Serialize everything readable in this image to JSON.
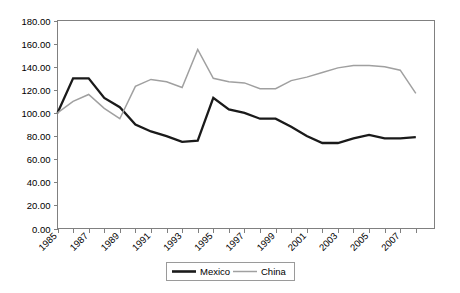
{
  "chart_data": {
    "type": "line",
    "title": "",
    "xlabel": "",
    "ylabel": "",
    "ylim": [
      0,
      180
    ],
    "ytick_step": 20,
    "ytick_labels": [
      "0.00",
      "20.00",
      "40.00",
      "60.00",
      "80.00",
      "100.00",
      "120.00",
      "140.00",
      "160.00",
      "180.00"
    ],
    "xtick_labels": [
      "1985",
      "1987",
      "1989",
      "1991",
      "1993",
      "1995",
      "1997",
      "1999",
      "2001",
      "2003",
      "2005",
      "2007"
    ],
    "x": [
      1985,
      1986,
      1987,
      1988,
      1989,
      1990,
      1991,
      1992,
      1993,
      1994,
      1995,
      1996,
      1997,
      1998,
      1999,
      2000,
      2001,
      2002,
      2003,
      2004,
      2005,
      2006,
      2007,
      2008
    ],
    "grid": false,
    "legend_position": "bottom",
    "series": [
      {
        "name": "Mexico",
        "color": "#1a1a1a",
        "values": [
          100,
          130,
          130,
          113,
          105,
          90,
          84,
          80,
          75,
          76,
          113,
          103,
          100,
          95,
          95,
          88,
          80,
          74,
          74,
          78,
          81,
          78,
          78,
          79
        ]
      },
      {
        "name": "China",
        "color": "#a0a0a0",
        "values": [
          100,
          110,
          116,
          104,
          95,
          123,
          129,
          127,
          122,
          155,
          130,
          127,
          126,
          121,
          121,
          128,
          131,
          135,
          139,
          141,
          141,
          140,
          137,
          117
        ]
      }
    ]
  },
  "legend": {
    "items": [
      {
        "label": "Mexico",
        "style": "thick-black-line"
      },
      {
        "label": "China",
        "style": "thin-gray-line"
      }
    ]
  },
  "axes": {
    "y_axis_name": "value-axis",
    "x_axis_name": "year-axis"
  }
}
